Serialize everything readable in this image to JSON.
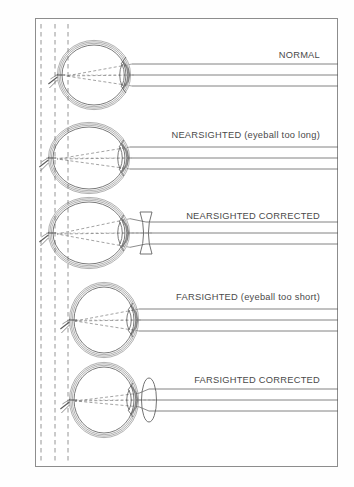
{
  "figure": {
    "title_present": false,
    "background_color": "#ffffff",
    "frame_color": "#8d8d8d",
    "ink_color": "#5a5a5a",
    "label_color": "#4a4a4a"
  },
  "guides": {
    "name": "vertical-dashed-reference-lines",
    "count": 3,
    "x_positions": [
      41,
      55,
      68
    ],
    "style": "dashed",
    "color": "#8a8a8a"
  },
  "rows": [
    {
      "id": "normal",
      "label": "NORMAL",
      "label_right": 320,
      "label_top": 50,
      "eye": {
        "name": "eye-normal",
        "cx": 94,
        "cy": 75,
        "rx": 32,
        "ry": 30,
        "shape": "round",
        "lens_cx": 122,
        "lens_ry": 11,
        "focus_x": 66,
        "focus_y": 76
      },
      "corrective_lens": null,
      "rays": {
        "count": 3,
        "enter_x": 338,
        "y_offsets": [
          -11,
          0,
          11
        ]
      }
    },
    {
      "id": "nearsighted",
      "label": "NEARSIGHTED (eyeball too long)",
      "label_right": 320,
      "label_top": 130,
      "eye": {
        "name": "eye-nearsighted",
        "cx": 89,
        "cy": 158,
        "rx": 36,
        "ry": 31,
        "shape": "elongated",
        "lens_cx": 120,
        "lens_ry": 11,
        "focus_x": 57,
        "focus_y": 159
      },
      "corrective_lens": null,
      "rays": {
        "count": 3,
        "enter_x": 338,
        "y_offsets": [
          -11,
          0,
          11
        ]
      }
    },
    {
      "id": "nearsighted-corrected",
      "label": "NEARSIGHTED CORRECTED",
      "label_right": 320,
      "label_top": 211,
      "eye": {
        "name": "eye-nearsighted-corrected",
        "cx": 89,
        "cy": 233,
        "rx": 36,
        "ry": 31,
        "shape": "elongated",
        "lens_cx": 120,
        "lens_ry": 11,
        "focus_x": 57,
        "focus_y": 234
      },
      "corrective_lens": {
        "name": "concave-diverging-lens",
        "type": "concave",
        "cx": 146,
        "cy": 233,
        "half_height": 21,
        "half_width": 6
      },
      "rays": {
        "count": 3,
        "enter_x": 338,
        "y_offsets": [
          -11,
          0,
          11
        ]
      }
    },
    {
      "id": "farsighted",
      "label": "FARSIGHTED (eyeball too short)",
      "label_right": 320,
      "label_top": 292,
      "eye": {
        "name": "eye-farsighted",
        "cx": 104,
        "cy": 320,
        "rx": 30,
        "ry": 33,
        "shape": "short",
        "lens_cx": 129,
        "lens_ry": 10,
        "focus_x": 75,
        "focus_y": 321
      },
      "corrective_lens": null,
      "rays": {
        "count": 3,
        "enter_x": 338,
        "y_offsets": [
          -11,
          0,
          11
        ]
      }
    },
    {
      "id": "farsighted-corrected",
      "label": "FARSIGHTED CORRECTED",
      "label_right": 320,
      "label_top": 375,
      "eye": {
        "name": "eye-farsighted-corrected",
        "cx": 104,
        "cy": 400,
        "rx": 30,
        "ry": 33,
        "shape": "short",
        "lens_cx": 129,
        "lens_ry": 10,
        "focus_x": 75,
        "focus_y": 401
      },
      "corrective_lens": {
        "name": "convex-converging-lens",
        "type": "convex",
        "cx": 149,
        "cy": 400,
        "half_height": 22,
        "half_width": 6
      },
      "rays": {
        "count": 3,
        "enter_x": 338,
        "y_offsets": [
          -11,
          0,
          11
        ]
      }
    }
  ]
}
